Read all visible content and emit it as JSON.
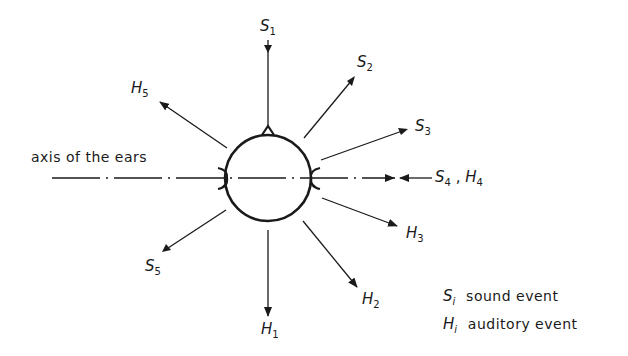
{
  "diagram": {
    "axis_label": "axis of the ears",
    "head": {
      "center": [
        268,
        178
      ],
      "radius": 43
    },
    "labels": {
      "S1": {
        "sym": "S",
        "sub": "1"
      },
      "S2": {
        "sym": "S",
        "sub": "2"
      },
      "S3": {
        "sym": "S",
        "sub": "3"
      },
      "S4H4": {
        "sym": "S",
        "sub": "4",
        "sep": " ,",
        "sym2": "H",
        "sub2": "4"
      },
      "S5": {
        "sym": "S",
        "sub": "5"
      },
      "H1": {
        "sym": "H",
        "sub": "1"
      },
      "H2": {
        "sym": "H",
        "sub": "2"
      },
      "H3": {
        "sym": "H",
        "sub": "3"
      },
      "H5": {
        "sym": "H",
        "sub": "5"
      }
    },
    "legend": [
      {
        "sym": "S",
        "sub": "i",
        "text": "sound event"
      },
      {
        "sym": "H",
        "sub": "i",
        "text": "auditory event"
      }
    ]
  }
}
